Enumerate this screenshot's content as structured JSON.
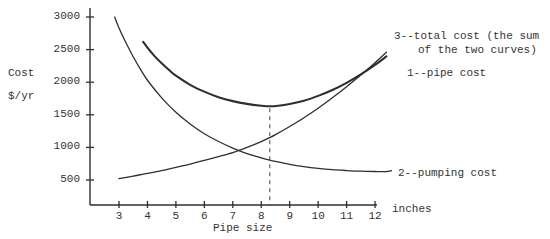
{
  "chart_data": {
    "type": "line",
    "title": "",
    "subtitle": "",
    "xlabel": "Pipe size",
    "xunit": "inches",
    "ylabel_line1": "Cost",
    "ylabel_line2": "$/yr",
    "xlim": [
      2.3,
      12.6
    ],
    "ylim": [
      0,
      3150
    ],
    "xticks": [
      3,
      4,
      5,
      6,
      7,
      8,
      9,
      10,
      11,
      12
    ],
    "xtick_labels": [
      "3",
      "4",
      "5",
      "6",
      "7",
      "8",
      "9",
      "10",
      "11",
      "12"
    ],
    "yticks": [
      500,
      1000,
      1500,
      2000,
      2500,
      3000
    ],
    "ytick_labels": [
      "500",
      "1000",
      "1500",
      "2000",
      "2500",
      "3000"
    ],
    "grid": false,
    "legend_position": "inline-right-annotations",
    "optimum": {
      "x": 8.3,
      "y": 1630,
      "marker": "dashed-vertical-line",
      "label": ""
    },
    "series": [
      {
        "name": "pipe cost",
        "annotation": "1--pipe cost",
        "annotation_x": 12.55,
        "annotation_y": 2180,
        "points": [
          [
            3.0,
            520
          ],
          [
            3.5,
            560
          ],
          [
            4.0,
            600
          ],
          [
            4.5,
            645
          ],
          [
            5.0,
            695
          ],
          [
            5.5,
            745
          ],
          [
            6.0,
            800
          ],
          [
            6.5,
            858
          ],
          [
            7.0,
            920
          ],
          [
            7.5,
            1000
          ],
          [
            8.0,
            1090
          ],
          [
            8.3,
            1150
          ],
          [
            8.5,
            1195
          ],
          [
            9.0,
            1320
          ],
          [
            9.5,
            1455
          ],
          [
            10.0,
            1600
          ],
          [
            10.5,
            1760
          ],
          [
            11.0,
            1930
          ],
          [
            11.5,
            2110
          ],
          [
            12.0,
            2300
          ],
          [
            12.4,
            2460
          ]
        ]
      },
      {
        "name": "pumping cost",
        "annotation": "2--pumping cost",
        "annotation_x": 12.55,
        "annotation_y": 640,
        "points": [
          [
            2.85,
            3000
          ],
          [
            3.0,
            2830
          ],
          [
            3.25,
            2600
          ],
          [
            3.5,
            2390
          ],
          [
            3.75,
            2200
          ],
          [
            4.0,
            2030
          ],
          [
            4.5,
            1760
          ],
          [
            5.0,
            1540
          ],
          [
            5.5,
            1360
          ],
          [
            6.0,
            1210
          ],
          [
            6.5,
            1090
          ],
          [
            7.0,
            990
          ],
          [
            7.5,
            905
          ],
          [
            8.0,
            840
          ],
          [
            8.3,
            805
          ],
          [
            8.5,
            785
          ],
          [
            9.0,
            740
          ],
          [
            9.5,
            705
          ],
          [
            10.0,
            678
          ],
          [
            10.5,
            658
          ],
          [
            11.0,
            645
          ],
          [
            11.5,
            635
          ],
          [
            12.0,
            630
          ],
          [
            12.4,
            628
          ]
        ]
      },
      {
        "name": "total cost",
        "annotation_line1": "3--total cost (the sum",
        "annotation_line2": "of the two curves)",
        "annotation_x": 12.55,
        "annotation_y": 2870,
        "points": [
          [
            3.85,
            2620
          ],
          [
            4.0,
            2530
          ],
          [
            4.25,
            2400
          ],
          [
            4.5,
            2290
          ],
          [
            4.75,
            2190
          ],
          [
            5.0,
            2100
          ],
          [
            5.5,
            1960
          ],
          [
            6.0,
            1855
          ],
          [
            6.5,
            1770
          ],
          [
            7.0,
            1710
          ],
          [
            7.5,
            1668
          ],
          [
            8.0,
            1640
          ],
          [
            8.3,
            1630
          ],
          [
            8.6,
            1638
          ],
          [
            9.0,
            1665
          ],
          [
            9.5,
            1715
          ],
          [
            10.0,
            1790
          ],
          [
            10.5,
            1880
          ],
          [
            11.0,
            1990
          ],
          [
            11.5,
            2120
          ],
          [
            12.0,
            2265
          ],
          [
            12.4,
            2395
          ]
        ]
      }
    ]
  }
}
